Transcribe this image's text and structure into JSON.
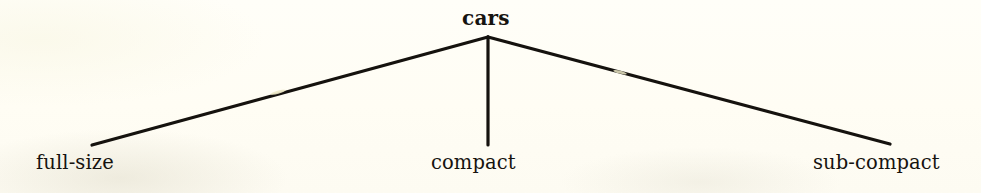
{
  "diagram": {
    "type": "tree",
    "title": "cars",
    "background_color": "#fffdf5",
    "line_color": "#15120e",
    "text_color": "#16130f",
    "root": {
      "label": "cars",
      "x": 488,
      "y": 37
    },
    "children": [
      {
        "label": "full-size",
        "x": 92,
        "y": 145
      },
      {
        "label": "compact",
        "x": 488,
        "y": 145
      },
      {
        "label": "sub-compact",
        "x": 890,
        "y": 144
      }
    ],
    "edges": [
      {
        "name": "edge-root-full-size",
        "from": [
          488,
          37
        ],
        "to": [
          92,
          145
        ]
      },
      {
        "name": "edge-root-compact",
        "from": [
          488,
          37
        ],
        "to": [
          488,
          145
        ]
      },
      {
        "name": "edge-root-sub-compact",
        "from": [
          488,
          37
        ],
        "to": [
          890,
          144
        ]
      }
    ],
    "scan_artifacts": [
      {
        "name": "ink-gap-left-branch",
        "x": 278,
        "y": 92,
        "color": "#e8e4c0"
      },
      {
        "name": "ink-gap-right-branch",
        "x": 620,
        "y": 75,
        "color": "#e8e4c0"
      }
    ]
  }
}
